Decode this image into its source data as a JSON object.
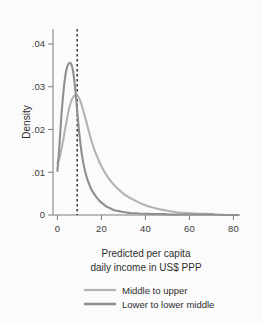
{
  "chart_data": {
    "type": "line",
    "title": "",
    "subtitle": "",
    "xlabel_line1": "Predicted per capita",
    "xlabel_line2": "daily income in US$ PPP",
    "ylabel": "Density",
    "xlim": [
      -2,
      83
    ],
    "ylim": [
      0,
      0.0435
    ],
    "xticks": [
      0,
      20,
      40,
      60,
      80
    ],
    "xtick_labels": [
      "0",
      "20",
      "40",
      "60",
      "80"
    ],
    "yticks": [
      0,
      0.01,
      0.02,
      0.03,
      0.04
    ],
    "ytick_labels": [
      "0",
      ".01",
      ".02",
      ".03",
      ".04"
    ],
    "grid": false,
    "legend_position": "bottom",
    "annotations": [
      {
        "name": "poverty-threshold-line",
        "type": "vline",
        "x": 9,
        "style": "dashed",
        "color": "#2b2b2b"
      }
    ],
    "series": [
      {
        "name": "Middle to upper",
        "color": "#b3b3b3",
        "width": 2.1,
        "x": [
          0,
          1,
          2,
          3,
          4,
          5,
          6,
          7,
          8,
          9,
          10,
          11,
          12,
          13,
          14,
          15,
          16,
          17,
          18,
          19,
          20,
          22,
          24,
          26,
          28,
          30,
          32,
          34,
          36,
          38,
          40,
          43,
          46,
          49,
          52,
          55,
          58,
          61,
          64,
          67,
          70,
          71
        ],
        "y": [
          0.0122,
          0.0134,
          0.0158,
          0.0186,
          0.0214,
          0.0242,
          0.0262,
          0.0274,
          0.028,
          0.028,
          0.0272,
          0.0258,
          0.024,
          0.0221,
          0.0201,
          0.0182,
          0.0165,
          0.015,
          0.0137,
          0.0125,
          0.0114,
          0.0096,
          0.0081,
          0.0069,
          0.0059,
          0.005,
          0.0043,
          0.0037,
          0.0032,
          0.0027,
          0.0023,
          0.0018,
          0.0014,
          0.0011,
          0.0008,
          0.0006,
          0.0005,
          0.0004,
          0.0003,
          0.0003,
          0.0002,
          0.0002
        ]
      },
      {
        "name": "Lower to lower middle",
        "color": "#8f8f8f",
        "width": 2.1,
        "x": [
          0,
          0.6,
          1.2,
          2,
          3,
          4,
          5,
          6,
          7,
          8,
          9,
          10,
          11,
          12,
          13,
          14,
          15,
          16,
          17,
          18,
          19,
          20,
          21,
          22,
          23,
          24,
          25,
          26,
          27,
          28,
          30,
          32,
          34,
          36,
          38,
          40,
          44,
          48,
          52,
          56,
          60,
          65,
          70,
          78,
          82
        ],
        "y": [
          0.0103,
          0.0139,
          0.0185,
          0.0244,
          0.03,
          0.0338,
          0.0353,
          0.0355,
          0.034,
          0.03,
          0.0244,
          0.0188,
          0.0146,
          0.0116,
          0.0094,
          0.0078,
          0.0065,
          0.0055,
          0.0047,
          0.004,
          0.0034,
          0.0029,
          0.0025,
          0.0021,
          0.0018,
          0.0016,
          0.0013,
          0.0011,
          0.001,
          0.0009,
          0.0007,
          0.0005,
          0.0004,
          0.0004,
          0.0003,
          0.0003,
          0.0002,
          0.0002,
          0.0001,
          0.0001,
          0.0001,
          0.0001,
          0.0001,
          0.0,
          0.0
        ]
      }
    ]
  },
  "legend": {
    "items": [
      {
        "label": "Middle to upper",
        "color": "#b3b3b3"
      },
      {
        "label": "Lower to lower middle",
        "color": "#8f8f8f"
      }
    ]
  },
  "colors": {
    "background": "#fbfbfb",
    "axis": "#7d7d7d",
    "text": "#2e2e2e",
    "series_light": "#b3b3b3",
    "series_dark": "#8f8f8f",
    "vline": "#2b2b2b"
  }
}
